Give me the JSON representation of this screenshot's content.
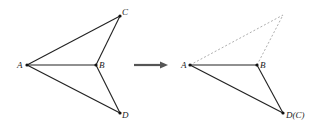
{
  "figure": {
    "left": {
      "points": {
        "A": {
          "label": "A",
          "x": 27,
          "y": 65
        },
        "B": {
          "label": "B",
          "x": 96,
          "y": 65
        },
        "C": {
          "label": "C",
          "x": 120,
          "y": 16
        },
        "D": {
          "label": "D",
          "x": 120,
          "y": 113
        }
      },
      "edges": [
        "AC",
        "AB",
        "AD",
        "BC",
        "BD"
      ]
    },
    "arrow": {
      "direction": "right",
      "color": "#555555"
    },
    "right": {
      "points": {
        "A": {
          "label": "A",
          "x": 190,
          "y": 65
        },
        "B": {
          "label": "B",
          "x": 257,
          "y": 65
        },
        "D": {
          "label": "D(C)",
          "x": 283,
          "y": 113
        },
        "apex": {
          "label": "",
          "x": 283,
          "y": 15
        }
      },
      "solid_edges": [
        "AB",
        "AD",
        "BD"
      ],
      "dashed_edges": [
        "A-apex",
        "B-apex"
      ]
    }
  }
}
